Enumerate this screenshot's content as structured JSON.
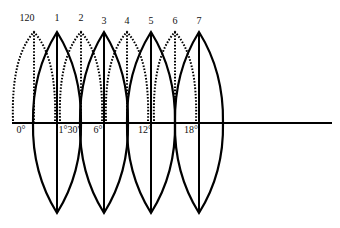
{
  "diagram": {
    "title": "",
    "six_degree_zones": {
      "style": "solid",
      "labels": [
        "1",
        "3",
        "5",
        "7"
      ]
    },
    "three_degree_zones": {
      "style": "dotted",
      "labels": [
        "120",
        "2",
        "4",
        "6"
      ]
    },
    "equator_ticks": [
      "0°",
      "1°30'",
      "6°",
      "12°",
      "18°"
    ]
  }
}
